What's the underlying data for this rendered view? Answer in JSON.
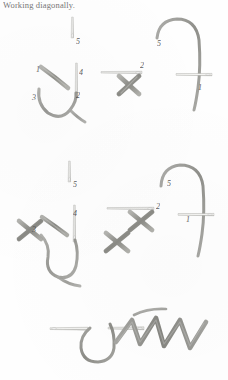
{
  "page": {
    "caption": "Working diagonally.",
    "width": 228,
    "height": 380,
    "background_color": "#fefefe"
  },
  "colors": {
    "thread": "#9b9b97",
    "thread_dark": "#7d7d79",
    "needle": "#c9c9c6",
    "needle_edge": "#a3a39f",
    "label_text": "#4a4a4a",
    "caption_text": "#585858"
  },
  "figures": [
    {
      "id": "row1-needle-up",
      "name": "needle-emerging-at-5",
      "labels": [
        {
          "text": "5",
          "x": 76,
          "y": 38
        }
      ]
    },
    {
      "id": "row1-first-stitch",
      "name": "first-diagonal-stitch-with-needle",
      "labels": [
        {
          "text": "1",
          "x": 36,
          "y": 68
        },
        {
          "text": "4",
          "x": 79,
          "y": 70
        },
        {
          "text": "3",
          "x": 32,
          "y": 95
        },
        {
          "text": "2",
          "x": 76,
          "y": 94
        }
      ]
    },
    {
      "id": "row1-cross-stitch",
      "name": "completed-cross-stitch-with-needle",
      "labels": [
        {
          "text": "2",
          "x": 140,
          "y": 63
        }
      ]
    },
    {
      "id": "row1-thread-loop",
      "name": "thread-loop-entering-at-1",
      "labels": [
        {
          "text": "5",
          "x": 157,
          "y": 41
        },
        {
          "text": "1",
          "x": 198,
          "y": 85
        }
      ]
    },
    {
      "id": "row2-needle-up",
      "name": "needle-emerging-at-5-second",
      "labels": [
        {
          "text": "5",
          "x": 73,
          "y": 182
        }
      ]
    },
    {
      "id": "row2-stitch-group",
      "name": "diagonal-progression-with-cross",
      "labels": [
        {
          "text": "3",
          "x": 32,
          "y": 228
        },
        {
          "text": "4",
          "x": 72,
          "y": 212
        }
      ]
    },
    {
      "id": "row2-two-crosses",
      "name": "two-completed-cross-stitches",
      "labels": [
        {
          "text": "2",
          "x": 156,
          "y": 204
        }
      ]
    },
    {
      "id": "row2-thread-loop",
      "name": "thread-loop-entering-at-1-second",
      "labels": [
        {
          "text": "5",
          "x": 167,
          "y": 181
        },
        {
          "text": "1",
          "x": 186,
          "y": 217
        }
      ]
    },
    {
      "id": "row3-zigzag",
      "name": "needle-with-zigzag-return-row",
      "labels": []
    }
  ]
}
